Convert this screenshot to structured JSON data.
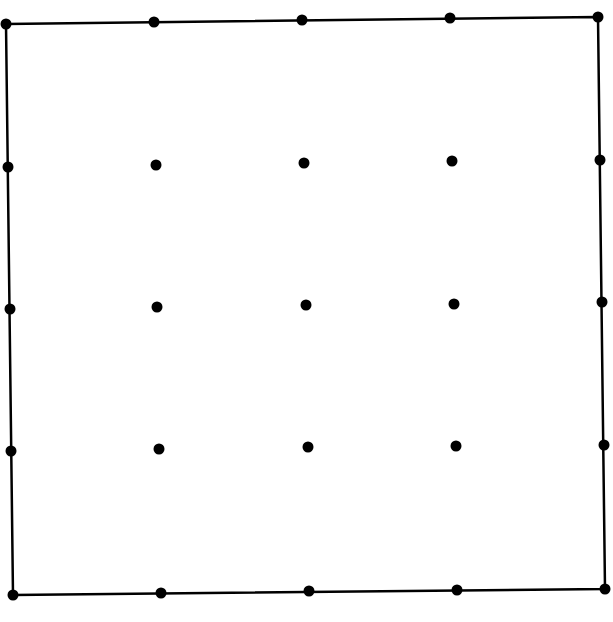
{
  "diagram": {
    "type": "dot-grid-in-square",
    "grid_size": 5,
    "colors": {
      "background": "#ffffff",
      "stroke": "#000000",
      "dot": "#000000"
    },
    "stroke_width": 2.5,
    "dot_radius": 5.5,
    "corners": {
      "top_left": [
        6,
        24
      ],
      "top_right": [
        598,
        17
      ],
      "bottom_right": [
        605,
        589
      ],
      "bottom_left": [
        13,
        595
      ]
    },
    "rows": [
      [
        [
          6,
          24
        ],
        [
          154,
          22
        ],
        [
          302,
          20
        ],
        [
          450,
          18
        ],
        [
          598,
          17
        ]
      ],
      [
        [
          8,
          167
        ],
        [
          156,
          165
        ],
        [
          304,
          163
        ],
        [
          452,
          161
        ],
        [
          600,
          160
        ]
      ],
      [
        [
          10,
          309
        ],
        [
          157,
          307
        ],
        [
          306,
          305
        ],
        [
          454,
          304
        ],
        [
          602,
          302
        ]
      ],
      [
        [
          11,
          451
        ],
        [
          159,
          449
        ],
        [
          308,
          447
        ],
        [
          456,
          446
        ],
        [
          604,
          445
        ]
      ],
      [
        [
          13,
          595
        ],
        [
          161,
          593
        ],
        [
          309,
          591
        ],
        [
          457,
          590
        ],
        [
          605,
          589
        ]
      ]
    ]
  }
}
